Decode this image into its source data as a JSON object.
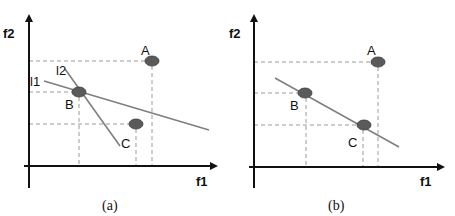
{
  "panels": [
    {
      "id": "a",
      "caption": "(a)",
      "x_axis_label": "f1",
      "y_axis_label": "f2",
      "points": [
        {
          "name": "A",
          "label": "A"
        },
        {
          "name": "B",
          "label": "B"
        },
        {
          "name": "C",
          "label": "C"
        }
      ],
      "lines": [
        {
          "name": "l1",
          "label": "l1"
        },
        {
          "name": "l2",
          "label": "l2"
        }
      ]
    },
    {
      "id": "b",
      "caption": "(b)",
      "x_axis_label": "f1",
      "y_axis_label": "f2",
      "points": [
        {
          "name": "A",
          "label": "A"
        },
        {
          "name": "B",
          "label": "B"
        },
        {
          "name": "C",
          "label": "C"
        }
      ],
      "lines": []
    }
  ],
  "colors": {
    "axis": "#111111",
    "point_fill": "#5a5a5a",
    "line": "#7f7f7f",
    "dashed_guide": "#9a9a9a"
  }
}
